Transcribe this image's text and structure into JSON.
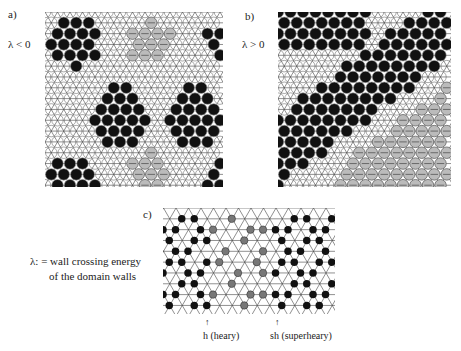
{
  "panels": {
    "a": {
      "label": "a)",
      "condition": "λ < 0"
    },
    "b": {
      "label": "b)",
      "condition": "λ > 0"
    },
    "c": {
      "label": "c)"
    }
  },
  "legend": {
    "line1": "λ: = wall crossing energy",
    "line2": "of the domain walls"
  },
  "annotations": {
    "heavy": "h (heary)",
    "superheavy": "sh (superheary)"
  },
  "colors": {
    "fill": "#111111",
    "lattice": "#333333",
    "hatched": "#666666",
    "background": "#ffffff"
  }
}
